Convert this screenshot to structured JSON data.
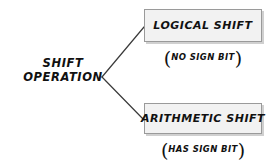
{
  "diagram": {
    "type": "branching-tree",
    "background_color": "#ffffff",
    "text_color": "#111111",
    "box_fill_color": "#f2f2f2",
    "box_border_color": "#9a9a9a",
    "line_color": "#3a3a3a",
    "root": {
      "label_line1": "SHIFT",
      "label_line2": "OPERATION"
    },
    "branches": [
      {
        "id": "logical",
        "box_label": "LOGICAL SHIFT",
        "note_open": "(",
        "note_text": "NO SIGN BIT",
        "note_close": ")"
      },
      {
        "id": "arithmetic",
        "box_label": "ARITHMETIC SHIFT",
        "note_open": "(",
        "note_text": "HAS SIGN BIT",
        "note_close": ")"
      }
    ],
    "connectors": [
      {
        "name": "root-to-logical",
        "from_x": 102,
        "from_y": 77,
        "to_x": 144,
        "to_y": 27
      },
      {
        "name": "root-to-arithmetic",
        "from_x": 102,
        "from_y": 77,
        "to_x": 144,
        "to_y": 120
      }
    ]
  }
}
